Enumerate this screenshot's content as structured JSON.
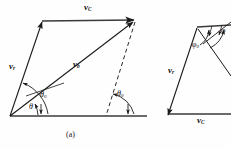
{
  "figure": {
    "caption": "(a)",
    "type": "vector-parallelogram-diagram",
    "panels": [
      {
        "id": "panel-a",
        "vectors": [
          {
            "name": "v_C",
            "label_main": "v",
            "label_sub": "C",
            "role": "horizontal-top-vector"
          },
          {
            "name": "v_r",
            "label_main": "v",
            "label_sub": "r",
            "role": "left-slanted-vector"
          },
          {
            "name": "v_b",
            "label_main": "v",
            "label_sub": "b",
            "role": "diagonal-resultant-vector"
          },
          {
            "name": "v_C_base",
            "label_main": "v",
            "label_sub": "C",
            "role": "horizontal-base-axis"
          }
        ],
        "angles": [
          {
            "name": "theta",
            "label_main": "θ",
            "label_sub": "",
            "role": "angle-between-base-and-diagonal"
          },
          {
            "name": "theta_0_left",
            "label_main": "θ",
            "label_sub": "0",
            "role": "angle-between-base-and-left-vector"
          },
          {
            "name": "theta_0_right",
            "label_main": "θ",
            "label_sub": "0",
            "role": "angle-at-right-dashed-line"
          }
        ]
      },
      {
        "id": "panel-b",
        "vectors": [
          {
            "name": "v_r",
            "label_main": "v",
            "label_sub": "r",
            "role": "left-slanted-vector"
          },
          {
            "name": "v_C",
            "label_main": "v",
            "label_sub": "C",
            "role": "horizontal-base-vector"
          }
        ],
        "angles": [
          {
            "name": "phi_0",
            "label_main": "φ",
            "label_sub": "0",
            "role": "angle-at-apex-inner"
          },
          {
            "name": "phi",
            "label_main": "φ",
            "label_sub": "",
            "role": "angle-at-apex-outer"
          }
        ]
      }
    ],
    "colors": {
      "stroke": "#1a1a1a",
      "background": "#fefefe",
      "text": "#111111"
    }
  }
}
